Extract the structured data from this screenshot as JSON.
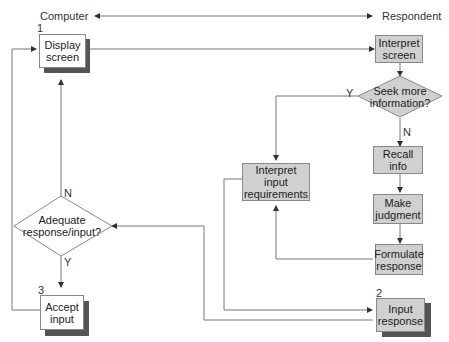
{
  "header": {
    "left_label": "Computer",
    "right_label": "Respondent"
  },
  "nodes": {
    "display_screen": {
      "number": "1",
      "label": "Display screen",
      "line1": "Display",
      "line2": "screen"
    },
    "interpret_screen": {
      "label": "Interpret screen",
      "line1": "Interpret",
      "line2": "screen"
    },
    "seek_more_info": {
      "label": "Seek more information?",
      "line1": "Seek more",
      "line2": "information?"
    },
    "recall_info": {
      "label": "Recall info"
    },
    "make_judgment": {
      "label": "Make judgment",
      "line1": "Make",
      "line2": "judgment"
    },
    "formulate_response": {
      "label": "Formulate response",
      "line1": "Formulate",
      "line2": "response"
    },
    "interpret_input_requirements": {
      "label": "Interpret input requirements",
      "line1": "Interpret",
      "line2": "input",
      "line3": "requirements"
    },
    "input_response": {
      "number": "2",
      "label": "Input response",
      "line1": "Input",
      "line2": "response"
    },
    "adequate_response": {
      "label": "Adequate response/input?",
      "line1": "Adequate",
      "line2": "response/input?"
    },
    "accept_input": {
      "number": "3",
      "label": "Accept input",
      "line1": "Accept",
      "line2": "input"
    }
  },
  "edge_labels": {
    "seek_yes": "Y",
    "seek_no": "N",
    "adequate_no": "N",
    "adequate_yes": "Y"
  },
  "colors": {
    "line": "#777777",
    "gray_box": "#d0d0d0",
    "shadow": "#555555",
    "white_box": "#ffffff"
  }
}
